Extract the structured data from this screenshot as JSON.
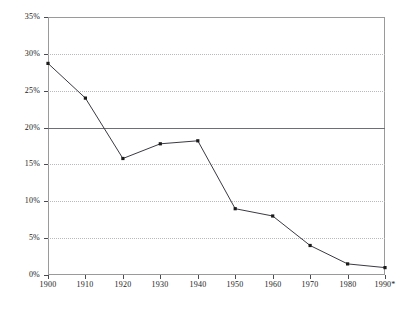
{
  "chart_data": {
    "type": "line",
    "title": "",
    "subtitle": "",
    "xlabel": "",
    "ylabel": "",
    "categories": [
      "1900",
      "1910",
      "1920",
      "1930",
      "1940",
      "1950",
      "1960",
      "1970",
      "1980",
      "1990*"
    ],
    "x": [
      1900,
      1910,
      1920,
      1930,
      1940,
      1950,
      1960,
      1970,
      1980,
      1990
    ],
    "values": [
      28.7,
      24.0,
      15.8,
      17.8,
      18.2,
      9.0,
      8.0,
      4.0,
      1.5,
      1.0
    ],
    "series": [
      {
        "name": "",
        "values": [
          28.7,
          24.0,
          15.8,
          17.8,
          18.2,
          9.0,
          8.0,
          4.0,
          1.5,
          1.0
        ]
      }
    ],
    "ylim": [
      0,
      35
    ],
    "xlim": [
      1900,
      1990
    ],
    "yticks": [
      0,
      5,
      10,
      15,
      20,
      25,
      30,
      35
    ],
    "ytick_labels": [
      "0%",
      "5%",
      "10%",
      "15%",
      "20%",
      "25%",
      "30%",
      "35%"
    ],
    "xtick_labels": [
      "1900",
      "1910",
      "1920",
      "1930",
      "1940",
      "1950",
      "1960",
      "1970",
      "1980",
      "1990*"
    ],
    "grid": true,
    "grid_style": "dotted",
    "legend": null,
    "legend_position": "none",
    "annotations": [
      "* asterisk on final x-axis label 1990*"
    ],
    "marker": "square-dot",
    "line_color": "#3a3a42",
    "marker_color": "#1a1a1a",
    "grid_color": "#b9b9bd",
    "axis_color": "#9a9a9a",
    "background_color": "#ffffff"
  },
  "axis": {
    "y": {
      "ticks": [
        {
          "label": "35%",
          "value": 35
        },
        {
          "label": "30%",
          "value": 30
        },
        {
          "label": "25%",
          "value": 25
        },
        {
          "label": "20%",
          "value": 20
        },
        {
          "label": "15%",
          "value": 15
        },
        {
          "label": "10%",
          "value": 10
        },
        {
          "label": "5%",
          "value": 5
        },
        {
          "label": "0%",
          "value": 0
        }
      ]
    },
    "x": {
      "ticks": [
        {
          "label": "1900"
        },
        {
          "label": "1910"
        },
        {
          "label": "1920"
        },
        {
          "label": "1930"
        },
        {
          "label": "1940"
        },
        {
          "label": "1950"
        },
        {
          "label": "1960"
        },
        {
          "label": "1970"
        },
        {
          "label": "1980"
        },
        {
          "label": "1990*"
        }
      ]
    }
  }
}
